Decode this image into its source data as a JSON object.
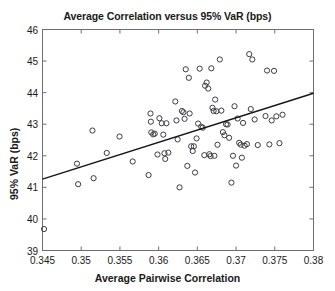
{
  "chart_data": {
    "type": "scatter",
    "title": "Average Correlation versus 95% VaR (bps)",
    "xlabel": "Average Pairwise Correlation",
    "ylabel": "95% VaR (bps)",
    "xlim": [
      0.345,
      0.38
    ],
    "ylim": [
      39,
      46
    ],
    "xticks": [
      0.345,
      0.35,
      0.355,
      0.36,
      0.365,
      0.37,
      0.375,
      0.38
    ],
    "xtick_labels": [
      "0.345",
      "0.35",
      "0.355",
      "0.36",
      "0.365",
      "0.37",
      "0.375",
      "0.38"
    ],
    "yticks": [
      39,
      40,
      41,
      42,
      43,
      44,
      45,
      46
    ],
    "ytick_labels": [
      "39",
      "40",
      "41",
      "42",
      "43",
      "44",
      "45",
      "46"
    ],
    "grid": false,
    "legend": null,
    "marker": "open-circle",
    "marker_color": "#3c3c46",
    "series": [
      {
        "name": "observations",
        "x": [
          0.3452,
          0.34945,
          0.3496,
          0.35145,
          0.3516,
          0.3533,
          0.35495,
          0.35665,
          0.3587,
          0.35895,
          0.359,
          0.35905,
          0.3593,
          0.3595,
          0.35985,
          0.3601,
          0.3604,
          0.3606,
          0.36075,
          0.36085,
          0.361,
          0.36125,
          0.36215,
          0.3623,
          0.36245,
          0.3627,
          0.363,
          0.3632,
          0.36335,
          0.3635,
          0.3637,
          0.3639,
          0.364,
          0.3642,
          0.3644,
          0.36455,
          0.3647,
          0.3649,
          0.3651,
          0.3653,
          0.3655,
          0.3657,
          0.3659,
          0.366,
          0.3662,
          0.3664,
          0.36655,
          0.3667,
          0.3668,
          0.36695,
          0.3671,
          0.3672,
          0.3673,
          0.36745,
          0.3676,
          0.3679,
          0.3681,
          0.3683,
          0.3685,
          0.3687,
          0.3689,
          0.3691,
          0.3694,
          0.3696,
          0.3698,
          0.37,
          0.3702,
          0.3704,
          0.3706,
          0.37075,
          0.3709,
          0.3711,
          0.3714,
          0.3717,
          0.3719,
          0.3721,
          0.3724,
          0.3728,
          0.3738,
          0.374,
          0.3743,
          0.3746,
          0.3749,
          0.3752,
          0.3756,
          0.376
        ],
        "y": [
          39.68,
          41.75,
          41.1,
          42.8,
          41.29,
          42.09,
          42.61,
          41.82,
          41.39,
          43.34,
          43.08,
          42.74,
          42.68,
          42.7,
          42.04,
          43.19,
          43.03,
          42.67,
          42.08,
          41.9,
          43.03,
          42.1,
          43.72,
          43.12,
          42.52,
          41.0,
          43.42,
          43.38,
          43.17,
          44.74,
          41.68,
          44.47,
          43.34,
          42.3,
          42.15,
          42.3,
          41.47,
          42.55,
          43.02,
          44.76,
          42.92,
          42.89,
          42.02,
          44.22,
          44.32,
          44.13,
          42.05,
          41.99,
          44.77,
          43.52,
          43.42,
          42.0,
          43.78,
          43.41,
          42.35,
          45.05,
          43.43,
          42.75,
          42.65,
          43.0,
          42.99,
          42.57,
          41.15,
          42.0,
          43.57,
          41.69,
          43.18,
          42.41,
          42.35,
          41.94,
          43.04,
          42.32,
          42.37,
          45.22,
          43.48,
          45.05,
          43.15,
          42.34,
          43.26,
          44.7,
          42.36,
          43.12,
          44.69,
          43.25,
          42.4,
          43.3
        ]
      }
    ],
    "trendline": {
      "name": "linear-fit",
      "x": [
        0.345,
        0.38
      ],
      "y": [
        41.26,
        43.98
      ]
    }
  }
}
